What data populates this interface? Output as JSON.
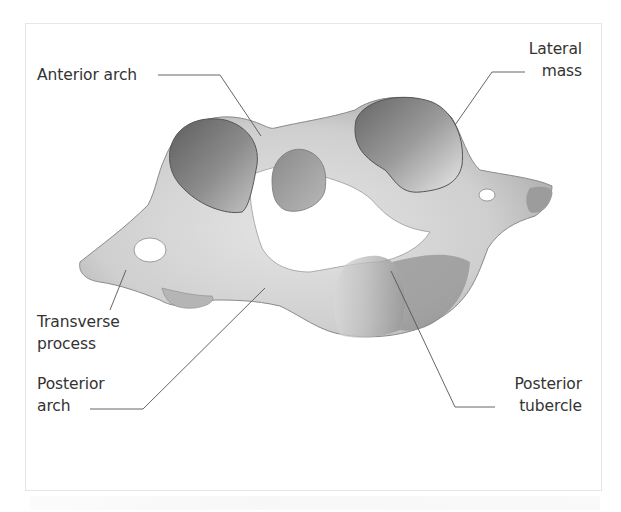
{
  "figure": {
    "colors": {
      "frame_border": "#e6e6e6",
      "label_text": "#333333",
      "leader_line": "#555555",
      "bone_light": "#e2e2e2",
      "bone_mid": "#bdbdbd",
      "bone_dark": "#7a7a7a"
    }
  },
  "labels": {
    "anterior_arch": {
      "lines": [
        "Anterior arch"
      ]
    },
    "lateral_mass": {
      "lines": [
        "Lateral",
        "mass"
      ]
    },
    "transverse_process": {
      "lines": [
        "Transverse",
        "process"
      ]
    },
    "posterior_arch": {
      "lines": [
        "Posterior",
        "arch"
      ]
    },
    "posterior_tubercle": {
      "lines": [
        "Posterior",
        "tubercle"
      ]
    }
  }
}
